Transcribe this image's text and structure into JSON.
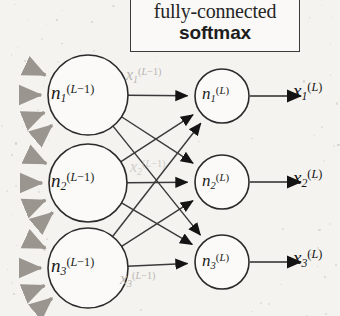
{
  "figure": {
    "type": "neural-network-diagram"
  },
  "annotation_box": {
    "line1": "fully-connected",
    "line2": "softmax"
  },
  "layers": {
    "previous": {
      "superscript": "(L−1)",
      "nodes": [
        {
          "base": "n",
          "sub": "1",
          "sup": "(L−1)"
        },
        {
          "base": "n",
          "sub": "2",
          "sup": "(L−1)"
        },
        {
          "base": "n",
          "sub": "3",
          "sup": "(L−1)"
        }
      ],
      "activations": [
        {
          "base": "x",
          "sub": "1",
          "sup": "(L−1)"
        },
        {
          "base": "x",
          "sub": "2",
          "sup": "(L−1)"
        },
        {
          "base": "x",
          "sub": "3",
          "sup": "(L−1)"
        }
      ]
    },
    "output": {
      "superscript": "(L)",
      "nodes": [
        {
          "base": "n",
          "sub": "1",
          "sup": "(L)"
        },
        {
          "base": "n",
          "sub": "2",
          "sup": "(L)"
        },
        {
          "base": "n",
          "sub": "3",
          "sup": "(L)"
        }
      ],
      "activations": [
        {
          "base": "x",
          "sub": "1",
          "sup": "(L)"
        },
        {
          "base": "x",
          "sub": "2",
          "sup": "(L)"
        },
        {
          "base": "x",
          "sub": "3",
          "sup": "(L)"
        }
      ]
    }
  },
  "connections": {
    "count": 9,
    "pattern": "fully-connected",
    "from_to": [
      [
        1,
        1
      ],
      [
        1,
        2
      ],
      [
        1,
        3
      ],
      [
        2,
        1
      ],
      [
        2,
        2
      ],
      [
        2,
        3
      ],
      [
        3,
        1
      ],
      [
        3,
        2
      ],
      [
        3,
        3
      ]
    ]
  },
  "incoming_fans": {
    "arrows_per_node": 4,
    "nodes": 3
  },
  "colors": {
    "background": "#f4f3f0",
    "ink": "#1a1a1a",
    "edge": "#3a3a3a",
    "faint_label": "#b8b5b0",
    "gray_arrow": "#9a958e",
    "box_border": "#3a3a3a"
  }
}
